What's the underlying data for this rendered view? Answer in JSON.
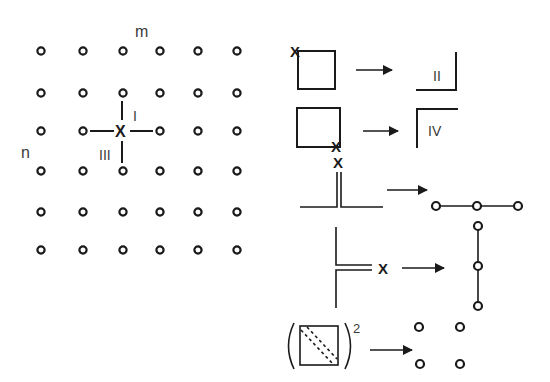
{
  "colors": {
    "ink": "#1a1a1a",
    "label": "#3a3a3a",
    "background": "#ffffff"
  },
  "lattice": {
    "axis_label_m": "m",
    "axis_label_n": "n",
    "columns_x": [
      41,
      83,
      123,
      160,
      198,
      237
    ],
    "rows_y": [
      51,
      93,
      131,
      171,
      212,
      250
    ],
    "site_mark": "X",
    "site_mark_position": {
      "x": 121,
      "y": 131
    },
    "quadrant_label_I": "I",
    "quadrant_label_III": "III"
  },
  "rules": [
    {
      "id": "rule-1",
      "lhs": "square with X on top-left corner",
      "lhs_mark": "X",
      "arrow": "right-arrow",
      "rhs": "bottom-right corner bracket",
      "rhs_label": "II"
    },
    {
      "id": "rule-2",
      "lhs": "square with X on bottom-right corner",
      "lhs_mark": "X",
      "arrow": "right-arrow",
      "rhs": "top-left corner bracket",
      "rhs_label": "IV"
    },
    {
      "id": "rule-3",
      "lhs": "inverted T with double vertical stem and X on top",
      "lhs_mark": "X",
      "arrow": "right-arrow",
      "rhs": "horizontal chain of three circles"
    },
    {
      "id": "rule-4",
      "lhs": "left T with double horizontal stem and X on right",
      "lhs_mark": "X",
      "arrow": "right-arrow",
      "rhs": "vertical chain of three circles"
    },
    {
      "id": "rule-5",
      "lhs": "square with dashed diagonals in parentheses, squared",
      "lhs_exponent": "2",
      "arrow": "right-arrow",
      "rhs": "four isolated circles in a 2x2 arrangement"
    }
  ]
}
